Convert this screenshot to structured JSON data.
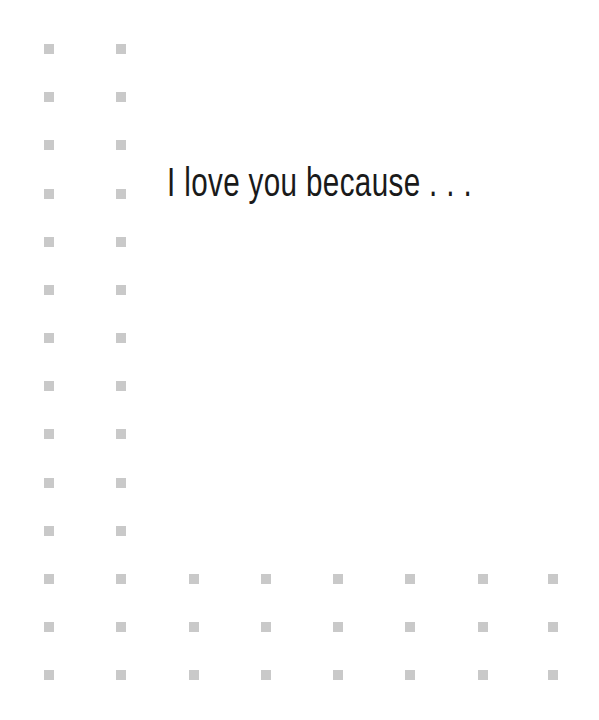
{
  "card": {
    "headline": "I love you because . . .",
    "background_color": "#ffffff",
    "square_color": "#c9c9c9"
  },
  "pattern": {
    "square_size": 10,
    "left_columns_x": [
      44,
      116
    ],
    "all_columns_x": [
      44,
      116,
      189,
      261,
      333,
      405,
      478,
      548
    ],
    "rows_y": [
      44,
      92,
      140,
      189,
      237,
      285,
      333,
      381,
      429,
      478,
      526,
      574,
      622,
      670
    ],
    "full_rows_start_index": 11
  }
}
